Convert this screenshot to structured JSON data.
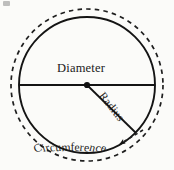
{
  "figure": {
    "type": "geometry-diagram",
    "background_color": "#fbfbf9",
    "stroke_color": "#1a1a1a",
    "canvas": {
      "width": 174,
      "height": 170
    },
    "labels": {
      "diameter": "Diameter",
      "radius": "Radius",
      "circumference": "Circumference"
    },
    "shapes": {
      "outer_circle": {
        "name": "circumference-dashed-circle",
        "style": "dashed",
        "center": {
          "x": 87,
          "y": 85
        },
        "radius": 76
      },
      "inner_circle": {
        "name": "circle-outline",
        "style": "solid",
        "center": {
          "x": 87,
          "y": 85
        },
        "radius": 68
      },
      "diameter_line": {
        "name": "diameter-line",
        "from": {
          "x": 19,
          "y": 85
        },
        "to": {
          "x": 155,
          "y": 85
        }
      },
      "radius_line": {
        "name": "radius-line",
        "from": {
          "x": 87,
          "y": 85
        },
        "to": {
          "x": 136,
          "y": 133
        }
      },
      "center_dot": {
        "name": "center-point",
        "x": 87,
        "y": 85,
        "radius": 3
      },
      "pointer_arrow": {
        "name": "circumference-pointer-arrow",
        "from": {
          "x": 140,
          "y": 132
        },
        "to": {
          "x": 118,
          "y": 145
        },
        "style": "dashed-with-arrowhead"
      }
    },
    "artifact": {
      "name": "scan-smudge",
      "visible": true
    }
  }
}
